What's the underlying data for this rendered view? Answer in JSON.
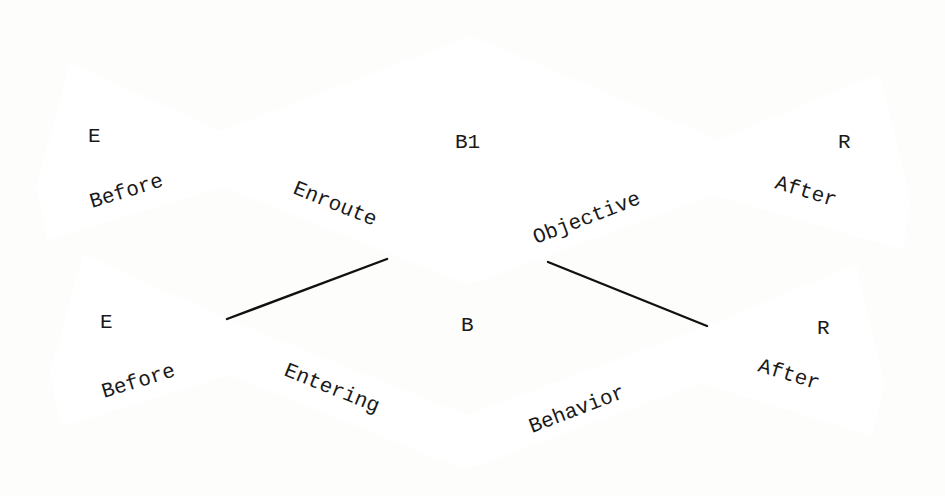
{
  "diagram": {
    "top": {
      "left_triangle_label": "E",
      "center_label": "B1",
      "right_triangle_label": "R",
      "bands": {
        "left": "Before",
        "center_left": "Enroute",
        "center_right": "Objective",
        "right": "After"
      }
    },
    "bottom": {
      "left_triangle_label": "E",
      "center_label": "B",
      "right_triangle_label": "R",
      "bands": {
        "left": "Before",
        "center_left": "Entering",
        "center_right": "Behavior",
        "right": "After"
      }
    },
    "colors": {
      "stroke": "#111111",
      "text": "#1a1a1a",
      "background": "#fdfdfc"
    }
  }
}
